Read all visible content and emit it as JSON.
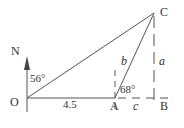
{
  "diagram": {
    "colors": {
      "line": "#555555",
      "text": "#333333",
      "background": "#ffffff"
    },
    "points": {
      "O": {
        "label": "O",
        "x": 27,
        "y": 98
      },
      "A": {
        "label": "A",
        "x": 115,
        "y": 98
      },
      "B": {
        "label": "B",
        "x": 155,
        "y": 98
      },
      "C": {
        "label": "C",
        "x": 154,
        "y": 13
      }
    },
    "north": {
      "label": "N"
    },
    "angles": {
      "north_to_OC": "56°",
      "at_A": "68°"
    },
    "sides": {
      "OA": "4.5",
      "AC": "b",
      "CB": "a",
      "AB": "c"
    }
  }
}
